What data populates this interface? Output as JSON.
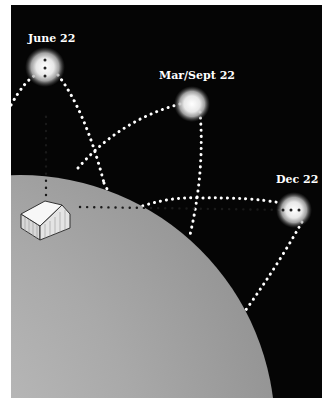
{
  "diagram": {
    "colors": {
      "background": "#050505",
      "globe": "#a8a8a8",
      "path_dots": "#ffffff",
      "sight_line_dots": "#2a2a2a",
      "sun_glow": "#ffffff"
    },
    "suns": [
      {
        "label": "June 22",
        "x": 45,
        "y": 67
      },
      {
        "label": "Mar/Sept 22",
        "x": 192,
        "y": 104
      },
      {
        "label": "Dec 22",
        "x": 294,
        "y": 210
      }
    ],
    "house": {
      "label": "house"
    }
  }
}
